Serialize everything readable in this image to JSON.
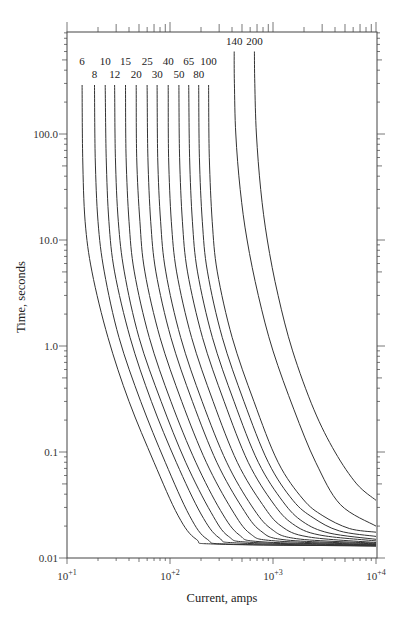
{
  "chart_data": {
    "type": "line",
    "title": "",
    "xlabel": "Current, amps",
    "ylabel": "Time, seconds",
    "xscale": "log",
    "yscale": "log",
    "xlim": [
      10,
      10000
    ],
    "ylim": [
      0.01,
      900
    ],
    "grid": false,
    "legend": "inline curve labels at top",
    "x_tick_labels": [
      "10+1",
      "10+2",
      "10+3",
      "10+4"
    ],
    "x_tick_values": [
      10,
      100,
      1000,
      10000
    ],
    "y_tick_labels": [
      "0.01",
      "0.1",
      "1.0",
      "10.0",
      "100.0"
    ],
    "y_tick_values": [
      0.01,
      0.1,
      1,
      10,
      100
    ],
    "series": [
      {
        "name": "6",
        "points": [
          [
            14,
            290
          ],
          [
            14.2,
            60
          ],
          [
            15,
            15
          ],
          [
            17.5,
            5
          ],
          [
            25,
            1.2
          ],
          [
            40,
            0.3
          ],
          [
            70,
            0.08
          ],
          [
            120,
            0.025
          ],
          [
            180,
            0.015
          ],
          [
            300,
            0.0135
          ],
          [
            10000,
            0.013
          ]
        ]
      },
      {
        "name": "8",
        "points": [
          [
            18.5,
            290
          ],
          [
            18.8,
            60
          ],
          [
            20,
            15
          ],
          [
            23,
            5
          ],
          [
            32,
            1.2
          ],
          [
            52,
            0.3
          ],
          [
            90,
            0.08
          ],
          [
            155,
            0.025
          ],
          [
            230,
            0.015
          ],
          [
            400,
            0.0135
          ],
          [
            10000,
            0.013
          ]
        ]
      },
      {
        "name": "10",
        "points": [
          [
            23.5,
            290
          ],
          [
            24,
            60
          ],
          [
            25.5,
            15
          ],
          [
            29,
            5
          ],
          [
            41,
            1.2
          ],
          [
            66,
            0.3
          ],
          [
            115,
            0.08
          ],
          [
            200,
            0.026
          ],
          [
            300,
            0.0155
          ],
          [
            500,
            0.0138
          ],
          [
            10000,
            0.013
          ]
        ]
      },
      {
        "name": "12",
        "points": [
          [
            29,
            290
          ],
          [
            29.5,
            60
          ],
          [
            31.5,
            15
          ],
          [
            36,
            5
          ],
          [
            50,
            1.2
          ],
          [
            82,
            0.3
          ],
          [
            142,
            0.08
          ],
          [
            250,
            0.027
          ],
          [
            370,
            0.016
          ],
          [
            650,
            0.014
          ],
          [
            10000,
            0.0132
          ]
        ]
      },
      {
        "name": "15",
        "points": [
          [
            37,
            290
          ],
          [
            37.5,
            60
          ],
          [
            40,
            15
          ],
          [
            45,
            5
          ],
          [
            63,
            1.2
          ],
          [
            102,
            0.3
          ],
          [
            178,
            0.08
          ],
          [
            310,
            0.028
          ],
          [
            470,
            0.0165
          ],
          [
            800,
            0.0142
          ],
          [
            10000,
            0.0133
          ]
        ]
      },
      {
        "name": "20",
        "points": [
          [
            47,
            290
          ],
          [
            47.5,
            60
          ],
          [
            51,
            15
          ],
          [
            57,
            5
          ],
          [
            80,
            1.2
          ],
          [
            130,
            0.3
          ],
          [
            225,
            0.08
          ],
          [
            395,
            0.029
          ],
          [
            600,
            0.017
          ],
          [
            1050,
            0.0145
          ],
          [
            10000,
            0.0134
          ]
        ]
      },
      {
        "name": "25",
        "points": [
          [
            60,
            290
          ],
          [
            61,
            60
          ],
          [
            65,
            15
          ],
          [
            73,
            5
          ],
          [
            102,
            1.2
          ],
          [
            165,
            0.3
          ],
          [
            285,
            0.08
          ],
          [
            500,
            0.03
          ],
          [
            760,
            0.018
          ],
          [
            1350,
            0.0148
          ],
          [
            10000,
            0.0136
          ]
        ]
      },
      {
        "name": "30",
        "points": [
          [
            75,
            290
          ],
          [
            76,
            60
          ],
          [
            81,
            15
          ],
          [
            91,
            5
          ],
          [
            127,
            1.2
          ],
          [
            205,
            0.3
          ],
          [
            355,
            0.08
          ],
          [
            620,
            0.031
          ],
          [
            950,
            0.019
          ],
          [
            1700,
            0.0152
          ],
          [
            10000,
            0.0138
          ]
        ]
      },
      {
        "name": "40",
        "points": [
          [
            96,
            290
          ],
          [
            97,
            60
          ],
          [
            103,
            15
          ],
          [
            116,
            5
          ],
          [
            162,
            1.2
          ],
          [
            262,
            0.3
          ],
          [
            450,
            0.08
          ],
          [
            790,
            0.032
          ],
          [
            1200,
            0.02
          ],
          [
            2200,
            0.0158
          ],
          [
            10000,
            0.014
          ]
        ]
      },
      {
        "name": "50",
        "points": [
          [
            122,
            290
          ],
          [
            124,
            60
          ],
          [
            132,
            15
          ],
          [
            148,
            5
          ],
          [
            207,
            1.2
          ],
          [
            335,
            0.3
          ],
          [
            575,
            0.08
          ],
          [
            1000,
            0.033
          ],
          [
            1550,
            0.021
          ],
          [
            2800,
            0.0165
          ],
          [
            10000,
            0.0145
          ]
        ]
      },
      {
        "name": "65",
        "points": [
          [
            152,
            290
          ],
          [
            155,
            60
          ],
          [
            165,
            15
          ],
          [
            185,
            5
          ],
          [
            258,
            1.2
          ],
          [
            418,
            0.3
          ],
          [
            720,
            0.08
          ],
          [
            1250,
            0.034
          ],
          [
            1950,
            0.022
          ],
          [
            3500,
            0.0172
          ],
          [
            10000,
            0.015
          ]
        ]
      },
      {
        "name": "80",
        "points": [
          [
            190,
            290
          ],
          [
            193,
            60
          ],
          [
            206,
            15
          ],
          [
            231,
            5
          ],
          [
            322,
            1.2
          ],
          [
            522,
            0.3
          ],
          [
            900,
            0.08
          ],
          [
            1560,
            0.035
          ],
          [
            2450,
            0.024
          ],
          [
            4400,
            0.018
          ],
          [
            10000,
            0.016
          ]
        ]
      },
      {
        "name": "100",
        "points": [
          [
            237,
            290
          ],
          [
            241,
            60
          ],
          [
            257,
            15
          ],
          [
            288,
            5
          ],
          [
            402,
            1.2
          ],
          [
            652,
            0.3
          ],
          [
            1120,
            0.08
          ],
          [
            1950,
            0.036
          ],
          [
            3050,
            0.025
          ],
          [
            5500,
            0.019
          ],
          [
            10000,
            0.0175
          ]
        ]
      },
      {
        "name": "140",
        "points": [
          [
            420,
            600
          ],
          [
            422,
            300
          ],
          [
            435,
            100
          ],
          [
            480,
            30
          ],
          [
            560,
            10
          ],
          [
            720,
            3
          ],
          [
            1000,
            0.9
          ],
          [
            1600,
            0.25
          ],
          [
            2600,
            0.08
          ],
          [
            4500,
            0.032
          ],
          [
            10000,
            0.02
          ]
        ]
      },
      {
        "name": "200",
        "points": [
          [
            660,
            600
          ],
          [
            665,
            300
          ],
          [
            690,
            100
          ],
          [
            760,
            30
          ],
          [
            880,
            10
          ],
          [
            1120,
            3
          ],
          [
            1550,
            0.9
          ],
          [
            2500,
            0.25
          ],
          [
            4000,
            0.1
          ],
          [
            6500,
            0.05
          ],
          [
            10000,
            0.035
          ]
        ]
      }
    ],
    "curve_label_rows": {
      "upper": [
        "6",
        "10",
        "15",
        "25",
        "40",
        "65",
        "100"
      ],
      "lower": [
        "8",
        "12",
        "20",
        "30",
        "50",
        "80"
      ],
      "top": [
        "140",
        "200"
      ]
    }
  }
}
